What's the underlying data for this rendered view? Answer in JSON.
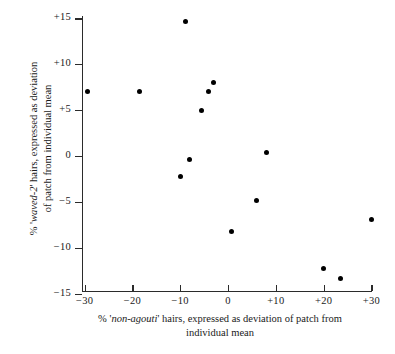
{
  "chart_data": {
    "type": "scatter",
    "title": "",
    "xlabel": "% 'non-agouti' hairs, expressed as deviation of patch from individual mean",
    "ylabel": "% 'waved-2' hairs, expressed as deviation of patch from individual mean",
    "xlim": [
      -32,
      32
    ],
    "ylim": [
      -15,
      15
    ],
    "grid": false,
    "legend": "none",
    "xticks": [
      -30,
      -20,
      -10,
      0,
      10,
      20,
      30
    ],
    "xtick_labels": [
      "-30",
      "-20",
      "-10",
      "0",
      "+10",
      "+20",
      "+30"
    ],
    "yticks": [
      -15,
      -10,
      -5,
      0,
      5,
      10,
      15
    ],
    "ytick_labels": [
      "-15",
      "-10",
      "-5",
      "0",
      "+5",
      "+10",
      "+15"
    ],
    "marker": "filled-circle",
    "marker_color": "#000000",
    "points": [
      {
        "x": -29.5,
        "y": 7.0
      },
      {
        "x": -18.5,
        "y": 7.0
      },
      {
        "x": -9.0,
        "y": 14.7
      },
      {
        "x": -8.0,
        "y": -0.4
      },
      {
        "x": -10.0,
        "y": -2.2
      },
      {
        "x": -4.0,
        "y": 7.0
      },
      {
        "x": -5.5,
        "y": 5.0
      },
      {
        "x": -3.0,
        "y": 8.0
      },
      {
        "x": 0.8,
        "y": -8.2
      },
      {
        "x": 5.9,
        "y": -4.8
      },
      {
        "x": 8.0,
        "y": 0.4
      },
      {
        "x": 20.0,
        "y": -12.3
      },
      {
        "x": 23.5,
        "y": -13.4
      },
      {
        "x": 30.0,
        "y": -6.9
      }
    ]
  },
  "axis_titles": {
    "y": {
      "prefix": "% '",
      "italic": "waved-2",
      "suffix": "' hairs, expressed as deviation",
      "line2": "of patch from individual mean"
    },
    "x": {
      "prefix": "% '",
      "italic": "non-agouti",
      "suffix": "' hairs, expressed as deviation of patch from",
      "line2": "individual mean"
    }
  }
}
